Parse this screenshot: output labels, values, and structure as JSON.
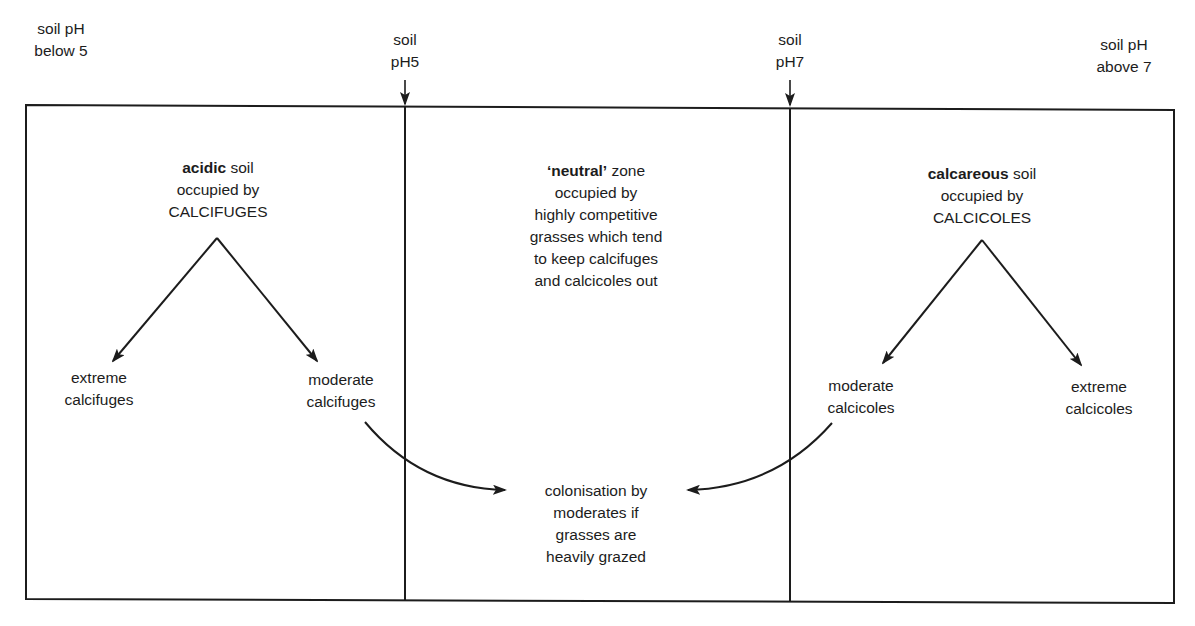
{
  "diagram": {
    "colors": {
      "ink": "#1c1c1c",
      "background": "#ffffff"
    },
    "top_labels": {
      "below5": {
        "line1": "soil pH",
        "line2": "below 5"
      },
      "ph5": {
        "line1": "soil",
        "line2": "pH5"
      },
      "ph7": {
        "line1": "soil",
        "line2": "pH7"
      },
      "above7": {
        "line1": "soil pH",
        "line2": "above 7"
      }
    },
    "zones": {
      "acidic": {
        "heading_bold": "acidic",
        "heading_rest": " soil",
        "line2": "occupied by",
        "line3": "CALCIFUGES",
        "branch_left": {
          "line1": "extreme",
          "line2": "calcifuges"
        },
        "branch_right": {
          "line1": "moderate",
          "line2": "calcifuges"
        }
      },
      "neutral": {
        "heading_bold": "‘neutral’",
        "heading_rest": " zone",
        "line2": "occupied by",
        "line3": "highly competitive",
        "line4": "grasses which tend",
        "line5": "to keep calcifuges",
        "line6": "and calcicoles out"
      },
      "calcareous": {
        "heading_bold": "calcareous",
        "heading_rest": " soil",
        "line2": "occupied by",
        "line3": "CALCICOLES",
        "branch_left": {
          "line1": "moderate",
          "line2": "calcicoles"
        },
        "branch_right": {
          "line1": "extreme",
          "line2": "calcicoles"
        }
      }
    },
    "colonisation": {
      "line1": "colonisation by",
      "line2": "moderates if",
      "line3": "grasses are",
      "line4": "heavily grazed"
    }
  }
}
